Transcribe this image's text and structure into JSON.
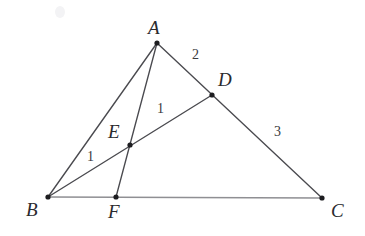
{
  "figure": {
    "width": 365,
    "height": 236,
    "background_color": "#ffffff",
    "line_color": "#4a4a4f",
    "base_line_color": "#8f8f93",
    "dot_color": "#1d1d20",
    "label_color": "#2a2a2e"
  },
  "points": [
    {
      "id": "A",
      "label": "A",
      "x": 157,
      "y": 43,
      "label_x": 148,
      "label_y": 18
    },
    {
      "id": "B",
      "label": "B",
      "x": 48,
      "y": 197,
      "label_x": 26,
      "label_y": 200
    },
    {
      "id": "C",
      "label": "C",
      "x": 322,
      "y": 198,
      "label_x": 331,
      "label_y": 201
    },
    {
      "id": "D",
      "label": "D",
      "x": 212,
      "y": 95,
      "label_x": 218,
      "label_y": 70
    },
    {
      "id": "E",
      "label": "E",
      "x": 130,
      "y": 145,
      "label_x": 108,
      "label_y": 122
    },
    {
      "id": "F",
      "label": "F",
      "x": 116,
      "y": 197,
      "label_x": 108,
      "label_y": 202
    }
  ],
  "segments": [
    {
      "id": "AB",
      "from": "A",
      "to": "B",
      "style": "normal"
    },
    {
      "id": "AC",
      "from": "A",
      "to": "C",
      "style": "normal"
    },
    {
      "id": "BC",
      "from": "B",
      "to": "C",
      "style": "base"
    },
    {
      "id": "AF",
      "from": "A",
      "to": "F",
      "style": "normal"
    },
    {
      "id": "BD",
      "from": "B",
      "to": "D",
      "style": "normal"
    }
  ],
  "length_labels": [
    {
      "id": "AD",
      "text": "2",
      "x": 192,
      "y": 48,
      "segment": "AD"
    },
    {
      "id": "DC",
      "text": "3",
      "x": 274,
      "y": 125,
      "segment": "DC"
    },
    {
      "id": "ED",
      "text": "1",
      "x": 157,
      "y": 102,
      "segment": "ED"
    },
    {
      "id": "BE",
      "text": "1",
      "x": 87,
      "y": 150,
      "segment": "BE"
    }
  ],
  "artifact": {
    "id": "smudge",
    "x": 60,
    "y": 12,
    "rx": 5,
    "ry": 6
  }
}
